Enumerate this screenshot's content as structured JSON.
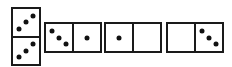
{
  "diagram": {
    "title": "",
    "colors": {
      "border": "#1a1a1a",
      "pip": "#111111",
      "background": "#ffffff"
    },
    "dominoes": [
      {
        "id": "domino-1",
        "orientation": "vertical",
        "x": 11,
        "y": 7,
        "w": 30,
        "h": 59,
        "halves": [
          3,
          3
        ],
        "pattern": "rising"
      },
      {
        "id": "domino-2",
        "orientation": "horizontal",
        "x": 44,
        "y": 22,
        "w": 58,
        "h": 31,
        "halves": [
          3,
          1
        ],
        "pattern": "falling"
      },
      {
        "id": "domino-3",
        "orientation": "horizontal",
        "x": 104,
        "y": 22,
        "w": 58,
        "h": 31,
        "halves": [
          1,
          0
        ],
        "pattern": "falling"
      },
      {
        "id": "domino-4",
        "orientation": "horizontal",
        "x": 166,
        "y": 22,
        "w": 58,
        "h": 31,
        "halves": [
          0,
          3
        ],
        "pattern": "falling"
      }
    ]
  }
}
